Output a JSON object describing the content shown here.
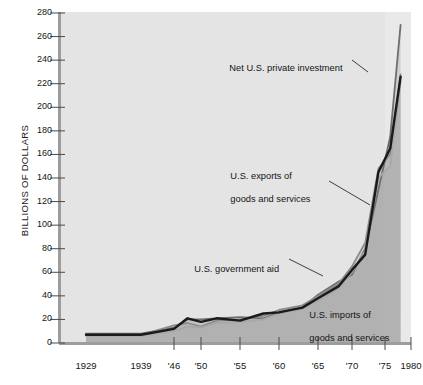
{
  "chart_data": {
    "type": "line",
    "title": "",
    "xlabel": "",
    "ylabel": "BILLIONS OF DOLLARS",
    "ylim": [
      0,
      280
    ],
    "xlim": [
      1929,
      1980
    ],
    "grid": false,
    "legend_position": "inline-annotations",
    "y_ticks": [
      0,
      20,
      40,
      60,
      80,
      100,
      120,
      140,
      160,
      180,
      200,
      220,
      240,
      260,
      280
    ],
    "x_ticks": [
      "1929",
      "1939",
      "'46",
      "'50",
      "'55",
      "'60",
      "'65",
      "'70",
      "'75",
      "1980"
    ],
    "x_tick_years": [
      1929,
      1939,
      1946,
      1950,
      1955,
      1960,
      1965,
      1970,
      1975,
      1980
    ],
    "series": [
      {
        "name": "Net U.S. private investment",
        "color": "#6f6f6f",
        "x": [
          1929,
          1939,
          1946,
          1948,
          1950,
          1952,
          1955,
          1958,
          1960,
          1963,
          1965,
          1968,
          1970,
          1972,
          1974,
          1976,
          1978
        ],
        "values": [
          8,
          8,
          13,
          20,
          20,
          21,
          22,
          21,
          26,
          30,
          41,
          52,
          58,
          80,
          130,
          175,
          270
        ]
      },
      {
        "name": "U.S. exports of goods and services",
        "color": "#8c8c8c",
        "x": [
          1929,
          1939,
          1946,
          1948,
          1950,
          1952,
          1955,
          1958,
          1960,
          1963,
          1965,
          1968,
          1970,
          1972,
          1974,
          1976,
          1978
        ],
        "values": [
          7,
          7,
          15,
          17,
          14,
          19,
          20,
          23,
          28,
          32,
          40,
          50,
          65,
          85,
          148,
          160,
          228
        ]
      },
      {
        "name": "U.S. government aid",
        "color": "#a8a8a8",
        "x": [
          1929,
          1939,
          1946,
          1948,
          1950,
          1952,
          1955,
          1958,
          1960,
          1963,
          1965,
          1968,
          1970,
          1972,
          1974,
          1976,
          1978
        ],
        "values": [
          6,
          6,
          10,
          14,
          13,
          17,
          18,
          20,
          25,
          29,
          36,
          46,
          60,
          78,
          140,
          150,
          222
        ]
      },
      {
        "name": "U.S. imports of goods and services",
        "color": "#1a1a1a",
        "x": [
          1929,
          1939,
          1946,
          1948,
          1950,
          1952,
          1955,
          1958,
          1960,
          1963,
          1965,
          1968,
          1970,
          1972,
          1974,
          1976,
          1978
        ],
        "values": [
          7,
          7,
          12,
          21,
          18,
          21,
          19,
          25,
          26,
          30,
          38,
          48,
          62,
          75,
          145,
          165,
          226
        ]
      }
    ],
    "annotations": [
      {
        "id": "net-private-investment",
        "line1": "Net U.S. private investment",
        "line2": ""
      },
      {
        "id": "exports",
        "line1": "U.S. exports of",
        "line2": "goods and services"
      },
      {
        "id": "government-aid",
        "line1": "U.S. government aid",
        "line2": ""
      },
      {
        "id": "imports",
        "line1": "U.S. imports of",
        "line2": "goods and services"
      }
    ]
  },
  "axes": {
    "y_title": "BILLIONS OF DOLLARS",
    "y_tick_labels": [
      "280",
      "260",
      "240",
      "220",
      "200",
      "180",
      "160",
      "140",
      "120",
      "100",
      "80",
      "60",
      "40",
      "20",
      "0"
    ],
    "x_tick_labels": [
      "1929",
      "1939",
      "'46",
      "'50",
      "'55",
      "'60",
      "'65",
      "'70",
      "'75",
      "1980"
    ]
  },
  "colors": {
    "plot_background": "#e9e9e9",
    "plot_background_shaded": "#dcdcdc",
    "axis": "#9a9a9a",
    "text": "#141414",
    "series_dark": "#1a1a1a",
    "series_mid": "#6f6f6f",
    "series_light": "#a8a8a8"
  }
}
